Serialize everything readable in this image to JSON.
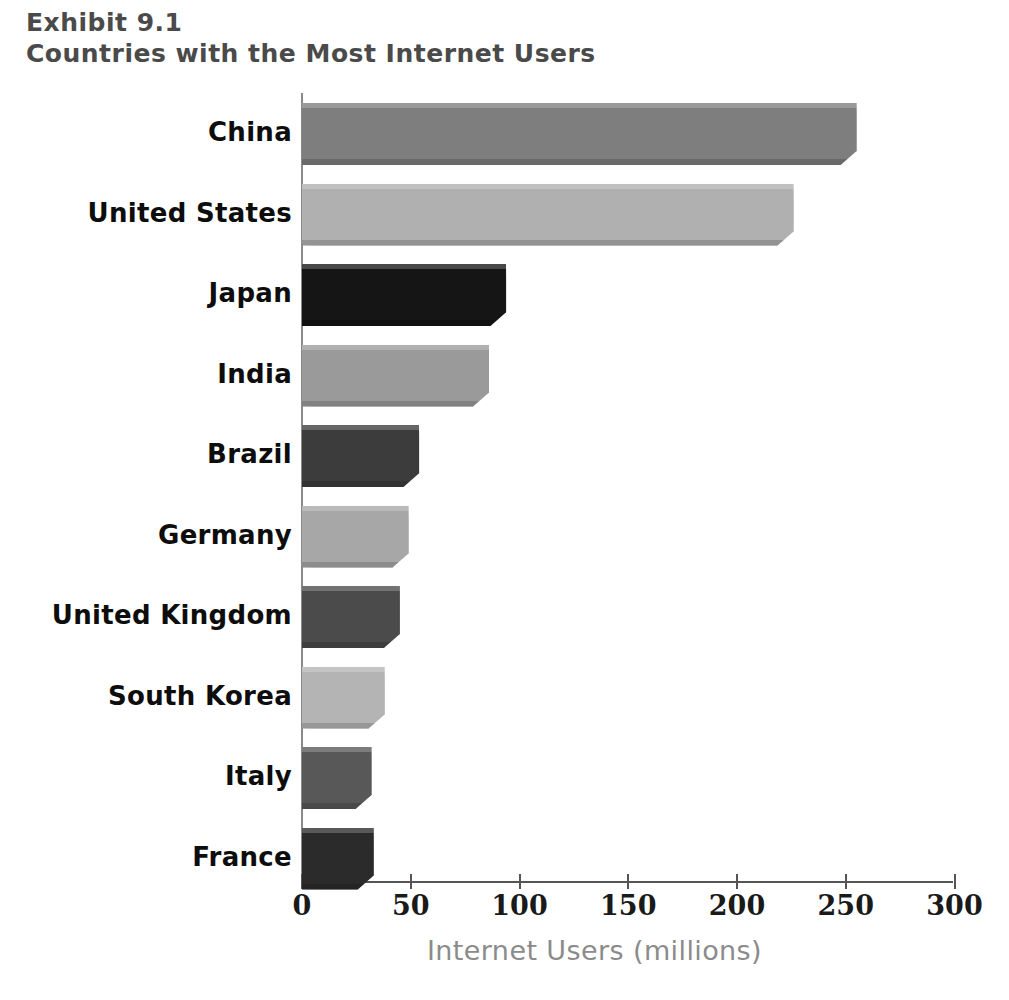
{
  "title": {
    "line1": "Exhibit 9.1",
    "line2": "Countries with the Most Internet Users"
  },
  "colors": {
    "title": "#4a4a4a",
    "axis": "#555555",
    "vaxis": "#8a8a8a",
    "tick_label": "#1a1a1a",
    "category_label": "#0d0d0d",
    "xaxis_title": "#8b8b8b",
    "background": "#ffffff"
  },
  "chart_data": {
    "type": "bar",
    "orientation": "horizontal",
    "xlabel": "Internet Users (millions)",
    "ylabel": "",
    "xlim": [
      0,
      315
    ],
    "xticks": [
      0,
      50,
      100,
      150,
      200,
      250,
      300
    ],
    "xtick_labels": [
      "0",
      "50",
      "100",
      "150",
      "200",
      "250",
      "300"
    ],
    "grid": false,
    "legend": "none",
    "categories": [
      "China",
      "United States",
      "Japan",
      "India",
      "Brazil",
      "Germany",
      "United Kingdom",
      "South Korea",
      "Italy",
      "France"
    ],
    "values": [
      255,
      226,
      94,
      86,
      54,
      49,
      45,
      38,
      32,
      33
    ],
    "bar_colors": [
      "#7e7e7e",
      "#b0b0b0",
      "#151515",
      "#9a9a9a",
      "#3c3c3c",
      "#a7a7a7",
      "#4b4b4b",
      "#b4b4b4",
      "#585858",
      "#2b2b2b"
    ]
  }
}
